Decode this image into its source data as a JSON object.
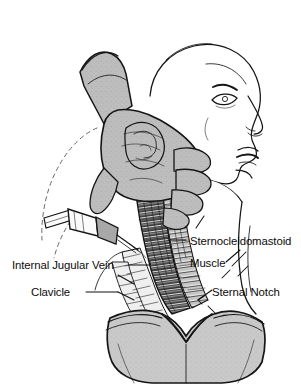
{
  "figure": {
    "background_color": "#ffffff",
    "ink_color": "#151515",
    "glove_color": "#b9b9b9",
    "chest_color": "#c6c6c6",
    "muscle_color": "#2a2a2a"
  },
  "labels": {
    "sternocleidomastoid": {
      "line1": "Sternocleidomastoid",
      "line2": "Muscle"
    },
    "internal_jugular_vein": "Internal Jugular Vein",
    "clavicle": "Clavicle",
    "sternal_notch": "Sternal Notch"
  }
}
